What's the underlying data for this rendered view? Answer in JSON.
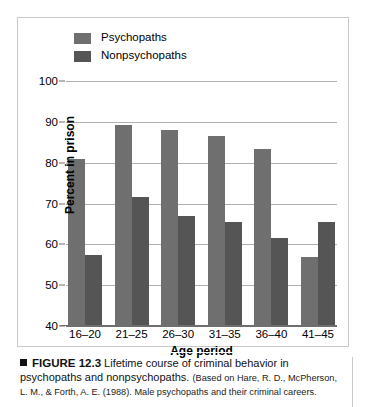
{
  "figure": {
    "caption_marker": "square-bullet",
    "figure_number": "FIGURE 12.3",
    "caption_text": "Lifetime course of criminal behavior in psychopaths and nonpsychopaths.",
    "citation": "(Based on Hare, R. D., McPherson, L. M., & Forth, A. E. (1988). Male psychopaths and their criminal careers."
  },
  "colors": {
    "psychopaths": "#6f6f6f",
    "nonpsychopaths": "#555555",
    "gridline": "#b0b0b0",
    "axis": "#6e6e6e",
    "panel_border": "#c9c9c9",
    "background": "#ffffff"
  },
  "chart_data": {
    "type": "bar",
    "title": "",
    "xlabel": "Age period",
    "ylabel": "Percent in prison",
    "categories": [
      "16–20",
      "21–25",
      "26–30",
      "31–35",
      "36–40",
      "41–45"
    ],
    "series": [
      {
        "name": "Psychopaths",
        "values": [
          81,
          89.3,
          88,
          86.5,
          83.3,
          57
        ]
      },
      {
        "name": "Nonpsychopaths",
        "values": [
          57.5,
          71.5,
          67,
          65.5,
          61.5,
          65.5
        ]
      }
    ],
    "ylim": [
      40,
      100
    ],
    "yticks": [
      40,
      50,
      60,
      70,
      80,
      90,
      100
    ],
    "ytick_labels": [
      "40",
      "50",
      "60",
      "70",
      "80",
      "90",
      "100"
    ],
    "grid": true,
    "legend_position": "top-left",
    "legend": [
      "Psychopaths",
      "Nonpsychopaths"
    ]
  }
}
